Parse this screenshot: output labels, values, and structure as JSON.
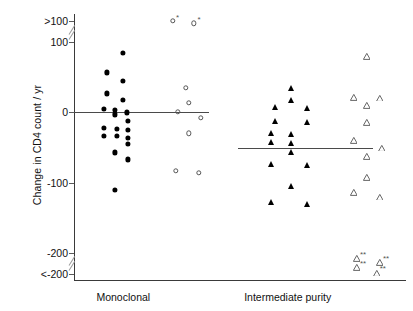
{
  "chart_data": {
    "type": "scatter",
    "title": "",
    "xlabel": "",
    "ylabel": "Change in CD4 count / yr",
    "ylim": [
      -200,
      100
    ],
    "y_axis_breaks": [
      {
        "between": [
          100,
          130
        ],
        "note": "break below >100 category"
      },
      {
        "between": [
          -200,
          -230
        ],
        "note": "break above <-200 category"
      }
    ],
    "yticks": [
      {
        "value": 130,
        "label": ">100"
      },
      {
        "value": 100,
        "label": "100"
      },
      {
        "value": 0,
        "label": "0"
      },
      {
        "value": -100,
        "label": "-100"
      },
      {
        "value": -200,
        "label": "-200"
      },
      {
        "value": -230,
        "label": "<-200"
      }
    ],
    "xticks": [
      {
        "value": 1,
        "label": "Monoclonal"
      },
      {
        "value": 2,
        "label": "Intermediate purity"
      }
    ],
    "grid": false,
    "legend": "none",
    "annotation_symbols": {
      "single_asterisk": "*",
      "double_asterisk": "**"
    },
    "series": [
      {
        "name": "Monoclonal - filled circle",
        "marker": "filled-circle",
        "group": "Monoclonal",
        "median": 0,
        "points": [
          {
            "x": 1.0,
            "y": 85
          },
          {
            "x": 0.9,
            "y": 57
          },
          {
            "x": 1.0,
            "y": 45
          },
          {
            "x": 0.9,
            "y": 27
          },
          {
            "x": 1.0,
            "y": 18
          },
          {
            "x": 0.88,
            "y": 5
          },
          {
            "x": 0.95,
            "y": 3
          },
          {
            "x": 1.02,
            "y": 0
          },
          {
            "x": 0.95,
            "y": -3
          },
          {
            "x": 1.03,
            "y": -12
          },
          {
            "x": 0.88,
            "y": -22
          },
          {
            "x": 0.96,
            "y": -23
          },
          {
            "x": 1.03,
            "y": -25
          },
          {
            "x": 0.88,
            "y": -33
          },
          {
            "x": 0.96,
            "y": -34
          },
          {
            "x": 1.03,
            "y": -36
          },
          {
            "x": 1.03,
            "y": -45
          },
          {
            "x": 0.95,
            "y": -57
          },
          {
            "x": 1.03,
            "y": -67
          },
          {
            "x": 0.95,
            "y": -110
          }
        ]
      },
      {
        "name": "Monoclonal - open circle",
        "marker": "open-circle",
        "group": "Monoclonal",
        "points": [
          {
            "x": 1.3,
            "y": 130,
            "note": "*"
          },
          {
            "x": 1.43,
            "y": 127,
            "note": "*"
          },
          {
            "x": 1.38,
            "y": 35
          },
          {
            "x": 1.4,
            "y": 14
          },
          {
            "x": 1.33,
            "y": 1
          },
          {
            "x": 1.47,
            "y": -8
          },
          {
            "x": 1.4,
            "y": -30
          },
          {
            "x": 1.32,
            "y": -83
          },
          {
            "x": 1.46,
            "y": -86
          }
        ]
      },
      {
        "name": "Intermediate purity - filled triangle",
        "marker": "filled-triangle",
        "group": "Intermediate purity",
        "median": -50,
        "points": [
          {
            "x": 2.02,
            "y": 35
          },
          {
            "x": 2.02,
            "y": 18
          },
          {
            "x": 1.92,
            "y": 7
          },
          {
            "x": 2.12,
            "y": 6
          },
          {
            "x": 1.92,
            "y": -12
          },
          {
            "x": 2.12,
            "y": -14
          },
          {
            "x": 1.9,
            "y": -30
          },
          {
            "x": 2.02,
            "y": -31
          },
          {
            "x": 1.9,
            "y": -42
          },
          {
            "x": 2.02,
            "y": -43
          },
          {
            "x": 2.02,
            "y": -57
          },
          {
            "x": 1.9,
            "y": -73
          },
          {
            "x": 2.12,
            "y": -75
          },
          {
            "x": 2.02,
            "y": -105
          },
          {
            "x": 1.9,
            "y": -128
          },
          {
            "x": 2.12,
            "y": -130
          }
        ]
      },
      {
        "name": "Intermediate purity - open triangle",
        "marker": "open-triangle",
        "group": "Intermediate purity",
        "points": [
          {
            "x": 2.48,
            "y": 80
          },
          {
            "x": 2.4,
            "y": 22
          },
          {
            "x": 2.56,
            "y": 21
          },
          {
            "x": 2.48,
            "y": 10
          },
          {
            "x": 2.48,
            "y": -14
          },
          {
            "x": 2.4,
            "y": -40
          },
          {
            "x": 2.57,
            "y": -50
          },
          {
            "x": 2.48,
            "y": -62
          },
          {
            "x": 2.48,
            "y": -92
          },
          {
            "x": 2.4,
            "y": -113
          },
          {
            "x": 2.56,
            "y": -120
          },
          {
            "x": 2.42,
            "y": -207,
            "note": "**"
          },
          {
            "x": 2.56,
            "y": -213,
            "note": "**"
          },
          {
            "x": 2.42,
            "y": -220,
            "note": "**"
          },
          {
            "x": 2.54,
            "y": -228,
            "note": "**"
          }
        ]
      }
    ]
  },
  "axis": {
    "y_label": "Change in CD4 count / yr",
    "y_tick_labels": [
      ">100",
      "100",
      "0",
      "-100",
      "-200",
      "<-200"
    ],
    "x_tick_labels": [
      "Monoclonal",
      "Intermediate purity"
    ]
  },
  "colors": {
    "axis": "#3a3a3a",
    "filled_marker": "#000000",
    "open_marker": "#555555",
    "median_line": "#4a4a4a",
    "background": "#ffffff"
  }
}
